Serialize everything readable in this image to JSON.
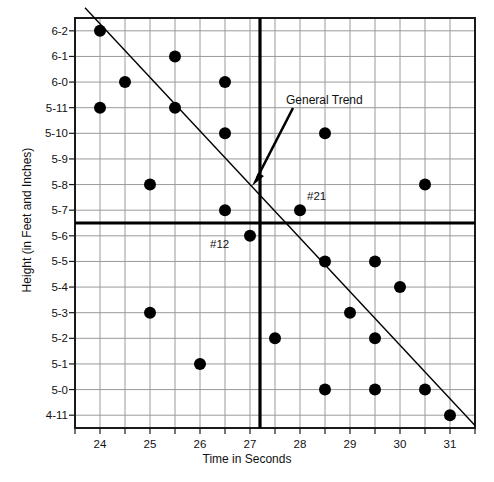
{
  "figure": {
    "x_axis_title": "Time in Seconds",
    "y_axis_title": "Height (in Feet and Inches)"
  },
  "annotations": {
    "trend": "General Trend",
    "point_12": "#12",
    "point_21": "#21"
  },
  "colors": {
    "marker": "#000000",
    "grid": "#9a9a9a",
    "axis": "#1a1a1a",
    "reference_line": "#000000",
    "trend_line": "#000000",
    "background": "#ffffff"
  },
  "chart_data": {
    "type": "scatter",
    "title": "",
    "xlabel": "Time in Seconds",
    "ylabel": "Height (in Feet and Inches)",
    "xlim": [
      23.5,
      31.5
    ],
    "ylim": [
      0,
      15
    ],
    "grid": true,
    "legend": "none",
    "x_ticks": [
      24,
      25,
      26,
      27,
      28,
      29,
      30,
      31
    ],
    "x_tick_labels": [
      "24",
      "25",
      "26",
      "27",
      "28",
      "29",
      "30",
      "31"
    ],
    "y_tick_labels": [
      "6-2",
      "6-1",
      "6-0",
      "5-11",
      "5-10",
      "5-9",
      "5-8",
      "5-7",
      "5-6",
      "5-5",
      "5-4",
      "5-3",
      "5-2",
      "5-1",
      "5-0",
      "4-11"
    ],
    "y_tick_values": [
      15,
      14,
      13,
      12,
      11,
      10,
      9,
      8,
      7,
      6,
      5,
      4,
      3,
      2,
      1,
      0
    ],
    "points": [
      {
        "x": 24.0,
        "y": 15,
        "height": "6-2",
        "label": ""
      },
      {
        "x": 25.5,
        "y": 14,
        "height": "6-1",
        "label": ""
      },
      {
        "x": 24.5,
        "y": 13,
        "height": "6-0",
        "label": ""
      },
      {
        "x": 26.5,
        "y": 13,
        "height": "6-0",
        "label": ""
      },
      {
        "x": 24.0,
        "y": 12,
        "height": "5-11",
        "label": ""
      },
      {
        "x": 25.5,
        "y": 12,
        "height": "5-11",
        "label": ""
      },
      {
        "x": 26.5,
        "y": 11,
        "height": "5-10",
        "label": ""
      },
      {
        "x": 28.5,
        "y": 11,
        "height": "5-10",
        "label": ""
      },
      {
        "x": 25.0,
        "y": 9,
        "height": "5-8",
        "label": ""
      },
      {
        "x": 30.5,
        "y": 9,
        "height": "5-8",
        "label": ""
      },
      {
        "x": 26.5,
        "y": 8,
        "height": "5-7",
        "label": ""
      },
      {
        "x": 28.0,
        "y": 8,
        "height": "5-7",
        "label": "#21"
      },
      {
        "x": 27.0,
        "y": 7,
        "height": "5-6",
        "label": "#12"
      },
      {
        "x": 28.5,
        "y": 6,
        "height": "5-5",
        "label": ""
      },
      {
        "x": 29.5,
        "y": 6,
        "height": "5-5",
        "label": ""
      },
      {
        "x": 30.0,
        "y": 5,
        "height": "5-4",
        "label": ""
      },
      {
        "x": 25.0,
        "y": 4,
        "height": "5-3",
        "label": ""
      },
      {
        "x": 29.0,
        "y": 4,
        "height": "5-3",
        "label": ""
      },
      {
        "x": 27.5,
        "y": 3,
        "height": "5-2",
        "label": ""
      },
      {
        "x": 29.5,
        "y": 3,
        "height": "5-2",
        "label": ""
      },
      {
        "x": 26.0,
        "y": 2,
        "height": "5-1",
        "label": ""
      },
      {
        "x": 28.5,
        "y": 1,
        "height": "5-0",
        "label": ""
      },
      {
        "x": 29.5,
        "y": 1,
        "height": "5-0",
        "label": ""
      },
      {
        "x": 30.5,
        "y": 1,
        "height": "5-0",
        "label": ""
      },
      {
        "x": 31.0,
        "y": 0,
        "height": "4-11",
        "label": ""
      }
    ],
    "trend_line": {
      "x_start": 23.7,
      "y_start": 15.9,
      "x_end": 31.5,
      "y_end": -0.4
    },
    "reference_lines": [
      {
        "orientation": "vertical",
        "value": 27.2
      },
      {
        "orientation": "horizontal",
        "value": 7.5
      }
    ]
  }
}
